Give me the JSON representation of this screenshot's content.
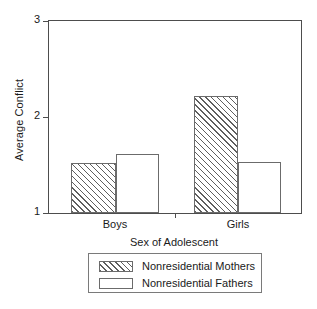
{
  "chart_data": {
    "type": "bar",
    "title": "",
    "xlabel": "Sex of Adolescent",
    "ylabel": "Average Conflict",
    "categories": [
      "Boys",
      "Girls"
    ],
    "series": [
      {
        "name": "Nonresidential Mothers",
        "values": [
          1.52,
          2.22
        ],
        "fill": "hatched"
      },
      {
        "name": "Nonresidential Fathers",
        "values": [
          1.61,
          1.53
        ],
        "fill": "white"
      }
    ],
    "ylim": [
      1,
      3
    ],
    "yticks": [
      "1",
      "2",
      "3"
    ],
    "ytick_values": [
      1,
      2,
      3
    ],
    "grid": false,
    "legend_position": "below-axes",
    "frame": "box",
    "colors": {
      "axis": "#4d4d4d",
      "bar_edge": "#6b6b6b",
      "hatch": "#5e5e5e",
      "background": "#ffffff",
      "text": "#1a1a1a"
    }
  },
  "axes": {
    "y": {
      "title": "Average Conflict",
      "ticks": [
        {
          "label": "3",
          "value": 3
        },
        {
          "label": "2",
          "value": 2
        },
        {
          "label": "1",
          "value": 1
        }
      ]
    },
    "x": {
      "title": "Sex of Adolescent",
      "ticks": [
        {
          "label": "Boys"
        },
        {
          "label": "Girls"
        }
      ]
    }
  },
  "legend": {
    "entries": [
      {
        "label": "Nonresidential Mothers",
        "fill": "hatched"
      },
      {
        "label": "Nonresidential Fathers",
        "fill": "white"
      }
    ]
  }
}
